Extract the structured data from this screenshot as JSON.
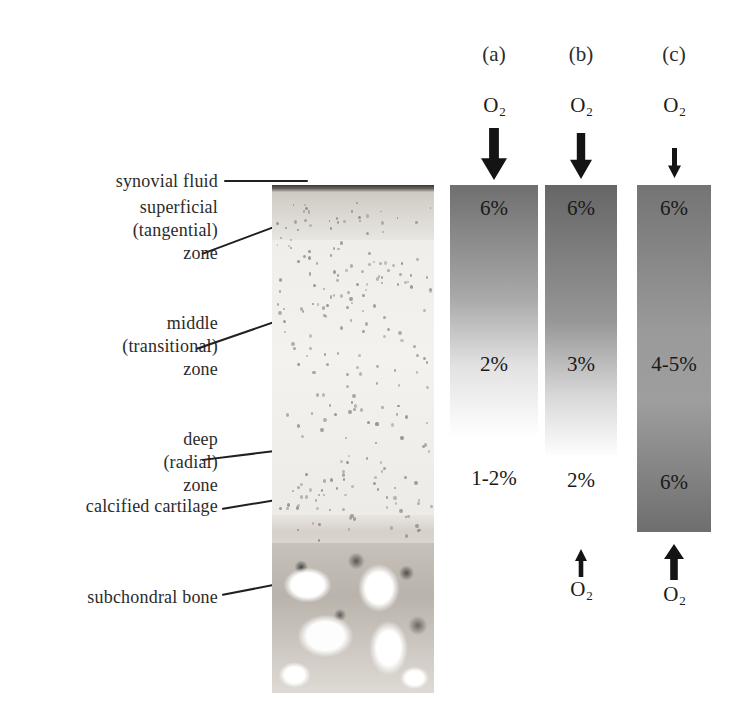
{
  "figure": {
    "background_color": "#ffffff"
  },
  "histology": {
    "caption": "articular cartilage histology section",
    "zones": [
      {
        "name": "synovial-fluid",
        "label": "synovial fluid"
      },
      {
        "name": "superficial-zone",
        "label": "superficial\n(tangential)\nzone"
      },
      {
        "name": "middle-zone",
        "label": "middle\n(transitional)\nzone"
      },
      {
        "name": "deep-zone",
        "label": "deep\n(radial)\nzone"
      },
      {
        "name": "calcified-cartilage",
        "label": "calcified cartilage"
      },
      {
        "name": "subchondral-bone",
        "label": "subchondral bone"
      }
    ]
  },
  "chart_data": {
    "type": "heatmap",
    "xlabel": "",
    "ylabel": "depth through cartilage",
    "legend_position": "none",
    "grid": false,
    "categories": [
      "(a)",
      "(b)",
      "(c)"
    ],
    "annotations": {
      "top_species": "O",
      "top_subscript": "2",
      "bottom_species": "O",
      "bottom_subscript": "2"
    },
    "columns": [
      {
        "id": "a",
        "label": "(a)",
        "top_gas_label": "O",
        "top_gas_subscript": "2",
        "top_arrow": {
          "direction": "down",
          "magnitude": "large"
        },
        "bottom_arrow": {
          "direction": "none",
          "magnitude": "none"
        },
        "bottom_gas_label": "",
        "values": [
          {
            "position": "top",
            "text": "6%",
            "value": 6,
            "inside_bar": true
          },
          {
            "position": "middle",
            "text": "2%",
            "value": 2,
            "inside_bar": true
          },
          {
            "position": "bottom",
            "text": "1-2%",
            "value": 1.5,
            "inside_bar": false
          }
        ],
        "gradient_top_gray": "#6f6f6f",
        "gradient_bottom_gray": "#ffffff",
        "gradient_stops": [
          {
            "offset": 0,
            "gray": "#6f6f6f"
          },
          {
            "offset": 45,
            "gray": "#a9a9a9"
          },
          {
            "offset": 72,
            "gray": "#e2e2e2"
          },
          {
            "offset": 100,
            "gray": "#ffffff"
          }
        ]
      },
      {
        "id": "b",
        "label": "(b)",
        "top_gas_label": "O",
        "top_gas_subscript": "2",
        "top_arrow": {
          "direction": "down",
          "magnitude": "medium"
        },
        "bottom_arrow": {
          "direction": "up",
          "magnitude": "small"
        },
        "bottom_gas_label": "O",
        "bottom_gas_subscript": "2",
        "values": [
          {
            "position": "top",
            "text": "6%",
            "value": 6,
            "inside_bar": true
          },
          {
            "position": "middle",
            "text": "3%",
            "value": 3,
            "inside_bar": true
          },
          {
            "position": "bottom",
            "text": "2%",
            "value": 2,
            "inside_bar": false
          }
        ],
        "gradient_top_gray": "#666666",
        "gradient_bottom_gray": "#ffffff",
        "gradient_stops": [
          {
            "offset": 0,
            "gray": "#666666"
          },
          {
            "offset": 50,
            "gray": "#969696"
          },
          {
            "offset": 78,
            "gray": "#d8d8d8"
          },
          {
            "offset": 100,
            "gray": "#fdfdfd"
          }
        ]
      },
      {
        "id": "c",
        "label": "(c)",
        "top_gas_label": "O",
        "top_gas_subscript": "2",
        "top_arrow": {
          "direction": "down",
          "magnitude": "small"
        },
        "bottom_arrow": {
          "direction": "up",
          "magnitude": "large"
        },
        "bottom_gas_label": "O",
        "bottom_gas_subscript": "2",
        "values": [
          {
            "position": "top",
            "text": "6%",
            "value": 6,
            "inside_bar": true
          },
          {
            "position": "middle",
            "text": "4-5%",
            "value": 4.5,
            "inside_bar": true
          },
          {
            "position": "bottom",
            "text": "6%",
            "value": 6,
            "inside_bar": true
          }
        ],
        "gradient_top_gray": "#747474",
        "gradient_bottom_gray": "#6e6e6e",
        "gradient_stops": [
          {
            "offset": 0,
            "gray": "#747474"
          },
          {
            "offset": 42,
            "gray": "#9a9a9a"
          },
          {
            "offset": 62,
            "gray": "#9e9e9e"
          },
          {
            "offset": 100,
            "gray": "#6e6e6e"
          }
        ]
      }
    ]
  }
}
